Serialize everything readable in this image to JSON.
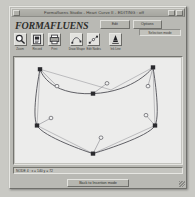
{
  "window": {
    "title": "Formafluens Studio - Heart Curve II - EDITING : off",
    "status_chip": "Selection mode",
    "logo": "FORMAFLUENS"
  },
  "mode_buttons": [
    {
      "label": "Edit"
    },
    {
      "label": "Options"
    }
  ],
  "toolbar": {
    "tools": [
      {
        "icon": "magnifier-icon",
        "label": "Zoom"
      },
      {
        "icon": "document-icon",
        "label": "Record"
      },
      {
        "icon": "printer-icon",
        "label": "Print"
      },
      {
        "icon": "curve-icon",
        "label": "Draw Shape"
      },
      {
        "icon": "nodes-icon",
        "label": "Edit Nodes"
      },
      {
        "icon": "pen-icon",
        "label": "Ink Line"
      }
    ]
  },
  "canvas": {
    "background": "#ececeb",
    "stroke_color": "#4b4b52",
    "node_fill": "#2a2a2e",
    "handle_fill": "#f2f2f2",
    "shape_name": "heart-bezier-path",
    "path": "M 25 12 C 25 12 32 40 78 38 C 120 36 138 10 138 10 C 138 10 146 60 140 72 C 134 84 84 100 78 102 C 72 100 28 84 22 72 C 16 60 25 12 25 12 Z",
    "anchors": [
      {
        "id": "a1",
        "x": 25,
        "y": 12
      },
      {
        "id": "a2",
        "x": 78,
        "y": 38
      },
      {
        "id": "a3",
        "x": 138,
        "y": 10
      },
      {
        "id": "a4",
        "x": 140,
        "y": 72
      },
      {
        "id": "a5",
        "x": 78,
        "y": 102
      },
      {
        "id": "a6",
        "x": 22,
        "y": 72
      }
    ],
    "handles": [
      {
        "id": "h1",
        "x": 42,
        "y": 30,
        "from_x": 25,
        "from_y": 12
      },
      {
        "id": "h2",
        "x": 92,
        "y": 27,
        "from_x": 78,
        "from_y": 38
      },
      {
        "id": "h3",
        "x": 133,
        "y": 30,
        "from_x": 138,
        "from_y": 10
      },
      {
        "id": "h4",
        "x": 131,
        "y": 61,
        "from_x": 140,
        "from_y": 72
      },
      {
        "id": "h5",
        "x": 86,
        "y": 85,
        "from_x": 78,
        "from_y": 102
      },
      {
        "id": "h6",
        "x": 36,
        "y": 64,
        "from_x": 22,
        "from_y": 72
      }
    ]
  },
  "info_bar": {
    "text": "NODE 4 :  x = 140   y = 72"
  },
  "footer": {
    "button_label": "Back to Insertion mode"
  },
  "colors": {
    "window_face": "#b9b9b4",
    "title_bar": "#aaaaa4",
    "canvas_bg": "#ececeb",
    "text": "#2e2e2c"
  }
}
